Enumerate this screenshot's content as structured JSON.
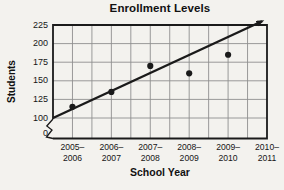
{
  "chart_data": {
    "type": "scatter",
    "title": "Enrollment Levels",
    "xlabel": "School Year",
    "ylabel": "Students",
    "categories": [
      "2005–2006",
      "2006–2007",
      "2007–2008",
      "2008–2009",
      "2009–2010",
      "2010–2011"
    ],
    "values": [
      115,
      135,
      170,
      160,
      185,
      null
    ],
    "trend_line": {
      "start_value": 100,
      "end_value": 230,
      "style": "arrow"
    },
    "y_ticks": [
      225,
      200,
      175,
      150,
      125,
      100,
      0
    ],
    "ylim_display": [
      100,
      225
    ],
    "axis_break": true,
    "grid": true,
    "legend": "none",
    "colors": {
      "ink": "#1a1a1a",
      "grid": "#8f8f8f",
      "paper": "#f3f2ee"
    }
  }
}
